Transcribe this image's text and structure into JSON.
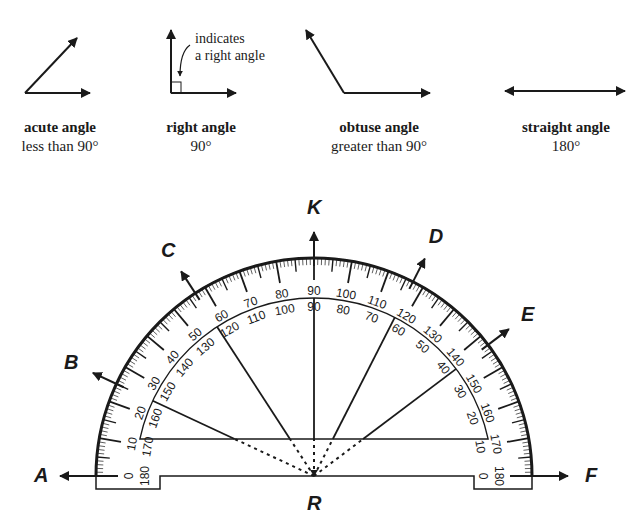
{
  "angle_types": [
    {
      "name": "acute angle",
      "description": "less than 90°"
    },
    {
      "name": "right angle",
      "description": "90°"
    },
    {
      "name": "obtuse angle",
      "description": "greater than 90°"
    },
    {
      "name": "straight angle",
      "description": "180°"
    }
  ],
  "right_angle_note": {
    "line1": "indicates",
    "line2": "a right angle"
  },
  "protractor": {
    "vertex_label": "R",
    "rays": [
      {
        "label": "A",
        "outer_scale_deg": 0
      },
      {
        "label": "B",
        "outer_scale_deg": 25
      },
      {
        "label": "C",
        "outer_scale_deg": 57
      },
      {
        "label": "K",
        "outer_scale_deg": 90
      },
      {
        "label": "D",
        "outer_scale_deg": 117
      },
      {
        "label": "E",
        "outer_scale_deg": 143
      },
      {
        "label": "F",
        "outer_scale_deg": 180
      }
    ],
    "outer_scale": [
      "0",
      "10",
      "20",
      "30",
      "40",
      "50",
      "60",
      "70",
      "80",
      "90",
      "100",
      "110",
      "120",
      "130",
      "140",
      "150",
      "160",
      "170",
      "180"
    ],
    "inner_scale": [
      "180",
      "170",
      "160",
      "150",
      "140",
      "130",
      "120",
      "110",
      "100",
      "90",
      "80",
      "70",
      "60",
      "50",
      "40",
      "30",
      "20",
      "10",
      "0"
    ]
  }
}
